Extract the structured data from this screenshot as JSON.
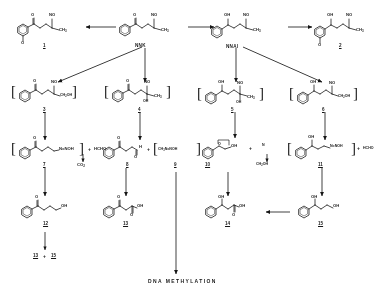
{
  "figure": {
    "type": "chemical-reaction-scheme",
    "title_text": "DNA METHYLATION",
    "background": "#ffffff",
    "ink": "#1a1a1a"
  },
  "compounds": {
    "nnk": {
      "name": "NNK",
      "label": "NNK",
      "ring": "pyridine",
      "groups": [
        "O",
        "NO",
        "CH3"
      ],
      "row": 1
    },
    "nnal": {
      "name": "NNAl",
      "label": "NNAl",
      "ring": "pyridine",
      "groups": [
        "OH",
        "NO",
        "CH3"
      ],
      "row": 1
    },
    "c1": {
      "number": "1",
      "ring": "pyridine-N-oxide",
      "groups": [
        "O",
        "NO",
        "CH3"
      ],
      "row": 1
    },
    "c2": {
      "number": "2",
      "ring": "pyridine-N-oxide",
      "groups": [
        "OH",
        "NO",
        "CH3"
      ],
      "row": 1
    },
    "c3": {
      "number": "3",
      "bracketed": true,
      "groups": [
        "O",
        "NO",
        "CH2OH"
      ],
      "row": 2
    },
    "c4": {
      "number": "4",
      "bracketed": true,
      "groups": [
        "O",
        "NO",
        "OH",
        "CH3"
      ],
      "row": 2
    },
    "c5": {
      "number": "5",
      "bracketed": true,
      "groups": [
        "OH",
        "NO",
        "OH",
        "CH3"
      ],
      "row": 2
    },
    "c6": {
      "number": "6",
      "bracketed": true,
      "groups": [
        "OH",
        "NO",
        "CH2OH"
      ],
      "row": 2
    },
    "c7": {
      "number": "7",
      "bracketed": true,
      "groups": [
        "O",
        "N=NOH"
      ],
      "row": 3
    },
    "c8": {
      "number": "8",
      "groups": [
        "O",
        "O",
        "H"
      ],
      "row": 3
    },
    "c9": {
      "number": "9",
      "bracketed": true,
      "groups": [
        "CH3N=NOH"
      ],
      "row": 3
    },
    "c10": {
      "number": "10",
      "groups": [
        "O",
        "OH"
      ],
      "row": 3
    },
    "c11": {
      "number": "11",
      "bracketed": true,
      "groups": [
        "OH",
        "N=NOH"
      ],
      "row": 3
    },
    "c12": {
      "number": "12",
      "groups": [
        "O",
        "OH"
      ],
      "row": 4
    },
    "c13": {
      "number": "13",
      "groups": [
        "O",
        "OH",
        "O"
      ],
      "row": 4
    },
    "c14": {
      "number": "14",
      "groups": [
        "OH",
        "OH",
        "O"
      ],
      "row": 4
    },
    "c15": {
      "number": "15",
      "groups": [
        "OH",
        "OH"
      ],
      "row": 4
    }
  },
  "coproducts": {
    "hcho_left": "HCHO",
    "co2": "CO",
    "co2_sub": "2",
    "ch2oh": "CH",
    "ch2oh_sub": "2",
    "ch2oh_tail": "OH",
    "hcho_right": "HCHO"
  },
  "atom_labels": {
    "O": "O",
    "OH": "OH",
    "NO": "NO",
    "CH3": "CH",
    "CH3_sub": "3",
    "CH2OH": "CH",
    "CH2OH_sub": "2",
    "CH2OH_tail": "OH",
    "N": "N",
    "H": "H",
    "N_eq_NOH": "N=NOH",
    "CH3N_eq_NOH": "CH",
    "CH3N_eq_NOH_sub": "3",
    "CH3N_eq_NOH_tail": "N=NOH",
    "plus": "+"
  },
  "sum_label": {
    "left": "13",
    "plus": "+",
    "right": "15"
  },
  "footer": {
    "text": "DNA  METHYLATION"
  }
}
